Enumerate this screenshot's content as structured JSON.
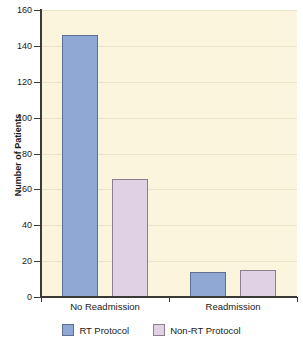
{
  "chart_data": {
    "type": "bar",
    "title": "",
    "subtitle": "",
    "xlabel": "",
    "ylabel": "Number of Patients",
    "categories": [
      "No Readmission",
      "Readmission"
    ],
    "series": [
      {
        "name": "RT Protocol",
        "values": [
          146,
          14
        ],
        "color": "#8fa8d4"
      },
      {
        "name": "Non-RT Protocol",
        "values": [
          66,
          15
        ],
        "color": "#e0d2e4"
      }
    ],
    "ylim": [
      0,
      160
    ],
    "ytick_step": 20,
    "yticks": [
      0,
      20,
      40,
      60,
      80,
      100,
      120,
      140,
      160
    ],
    "ytick_labels": [
      "0",
      "20",
      "40",
      "60",
      "80",
      "100",
      "120",
      "140",
      "160"
    ],
    "grid": true,
    "grid_axis": "y",
    "legend": true,
    "legend_position": "bottom",
    "plot_background": "#faf5dc",
    "figure_background": "#ffffff",
    "grid_color": "#ece4c6",
    "axis_color": "#3a3a36"
  }
}
